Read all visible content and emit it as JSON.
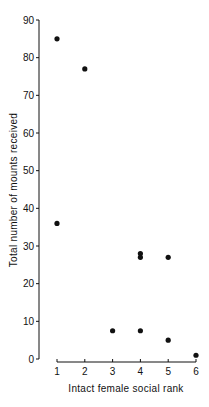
{
  "chart_data": {
    "type": "scatter",
    "title": "",
    "xlabel": "Intact female social rank",
    "ylabel": "Total number of mounts received",
    "xlim": [
      1,
      6
    ],
    "ylim": [
      0,
      90
    ],
    "xticks": [
      1,
      2,
      3,
      4,
      5,
      6
    ],
    "yticks": [
      0,
      10,
      20,
      30,
      40,
      50,
      60,
      70,
      80,
      90
    ],
    "grid": false,
    "legend": null,
    "points": [
      {
        "x": 1,
        "y": 85
      },
      {
        "x": 2,
        "y": 77
      },
      {
        "x": 1,
        "y": 36
      },
      {
        "x": 4,
        "y": 28
      },
      {
        "x": 4,
        "y": 27
      },
      {
        "x": 5,
        "y": 27
      },
      {
        "x": 3,
        "y": 7.5
      },
      {
        "x": 4,
        "y": 7.5
      },
      {
        "x": 5,
        "y": 5
      },
      {
        "x": 6,
        "y": 1
      }
    ],
    "marker_color": "#111111"
  }
}
